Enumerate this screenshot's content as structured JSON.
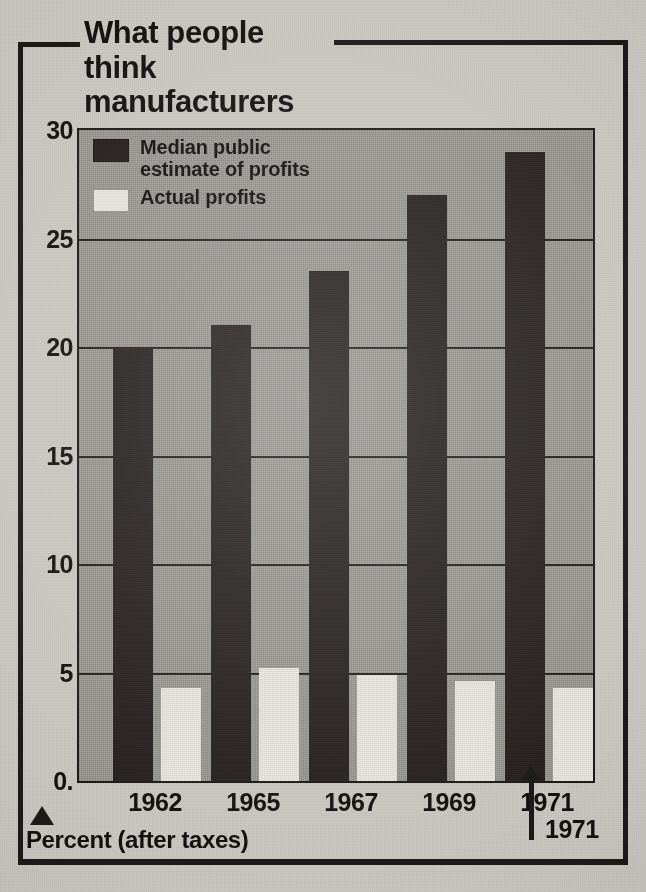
{
  "title": "What people think\nmanufacturers earn",
  "title_line1": "What people think",
  "title_line2": "manufacturers earn",
  "footer": {
    "marker_icon": "triangle-up-icon",
    "label": "Percent (after taxes)"
  },
  "callout": {
    "arrow_icon": "arrow-up-icon",
    "year": "1971"
  },
  "legend": [
    {
      "key": "median_estimate",
      "label": "Median public\nestimate of profits",
      "label_line1": "Median public",
      "label_line2": "estimate of profits",
      "swatch": "dark",
      "color": "#25201d"
    },
    {
      "key": "actual",
      "label": "Actual profits",
      "label_line1": "Actual profits",
      "label_line2": "",
      "swatch": "light",
      "color": "#e9e7e1"
    }
  ],
  "colors": {
    "paper": "#ccc9c2",
    "plot_background": "#9e9b95",
    "ink": "#1d1b19",
    "series_dark": "#25201d",
    "series_light": "#e9e7e1"
  },
  "chart_data": {
    "type": "bar",
    "title": "What people think manufacturers earn",
    "subtitle": "",
    "xlabel": "",
    "ylabel": "Percent (after taxes)",
    "categories": [
      "1962",
      "1965",
      "1967",
      "1969",
      "1971"
    ],
    "series": [
      {
        "name": "Median public estimate of profits",
        "color": "#25201d",
        "values": [
          20,
          21,
          23.5,
          27,
          29
        ]
      },
      {
        "name": "Actual profits",
        "color": "#e9e7e1",
        "values": [
          4.3,
          5.2,
          4.9,
          4.6,
          4.3
        ]
      }
    ],
    "ylim": [
      0,
      30
    ],
    "yticks": [
      0,
      5,
      10,
      15,
      20,
      25,
      30
    ],
    "ytick_labels": [
      "0.",
      "5",
      "10",
      "15",
      "20",
      "25",
      "30"
    ],
    "grid": true,
    "grid_axis": "y",
    "legend_position": "top-left",
    "annotations": [
      {
        "text": "1971",
        "target_category": "1971",
        "marker": "arrow-up"
      }
    ]
  }
}
